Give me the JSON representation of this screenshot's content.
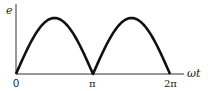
{
  "chart_data": {
    "type": "line",
    "title": "",
    "xlabel": "ωt",
    "ylabel": "e",
    "x_ticks": [
      "0",
      "π",
      "2π"
    ],
    "x": [
      0,
      0.7854,
      1.5708,
      2.3562,
      3.1416,
      3.927,
      4.7124,
      5.4978,
      6.2832
    ],
    "series": [
      {
        "name": "e = |sin ωt| (full-wave rectified sine)",
        "values": [
          0,
          0.707,
          1,
          0.707,
          0,
          0.707,
          1,
          0.707,
          0
        ]
      }
    ],
    "xlim": [
      0,
      6.2832
    ],
    "ylim": [
      0,
      1.1
    ],
    "grid": false,
    "legend": "none"
  },
  "axes": {
    "y_label": "e",
    "x_label": "ωt",
    "tick_0": "0",
    "tick_pi": "π",
    "tick_2pi": "2π"
  },
  "colors": {
    "curve": "#111111",
    "axis": "#333333"
  }
}
